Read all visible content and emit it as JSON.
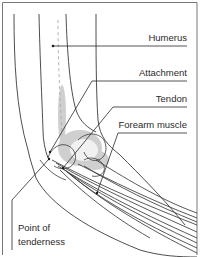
{
  "figure": {
    "type": "anatomical-illustration",
    "colors": {
      "line": "#3a3a3a",
      "stipple": "#9a9a9a",
      "frame": "#777777",
      "background": "#ffffff"
    },
    "labels": [
      {
        "id": "humerus",
        "text": "Humerus"
      },
      {
        "id": "attachment",
        "text": "Attachment"
      },
      {
        "id": "tendon",
        "text": "Tendon"
      },
      {
        "id": "forearm_muscle",
        "text": "Forearm muscle"
      },
      {
        "id": "point_of_tenderness",
        "lines": [
          "Point of",
          "tenderness"
        ]
      }
    ]
  }
}
